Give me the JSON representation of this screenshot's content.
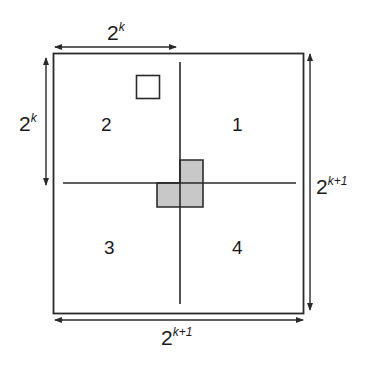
{
  "diagram": {
    "quadrants": [
      {
        "id": "1",
        "label": "1"
      },
      {
        "id": "2",
        "label": "2"
      },
      {
        "id": "3",
        "label": "3"
      },
      {
        "id": "4",
        "label": "4"
      }
    ],
    "dimensions": {
      "top": {
        "base": "2",
        "exp": "k"
      },
      "left": {
        "base": "2",
        "exp": "k"
      },
      "right": {
        "base": "2",
        "exp": "k+1"
      },
      "bottom": {
        "base": "2",
        "exp": "k+1"
      }
    },
    "colors": {
      "line": "#2a2a2a",
      "tile_fill": "#c8c8c8",
      "background": "#ffffff"
    },
    "elements": {
      "missing_cell": "small white square in quadrant 2",
      "center_tromino": "gray L-shaped tromino covering one cell of quadrants 1, 3 and 4 at the center"
    }
  }
}
